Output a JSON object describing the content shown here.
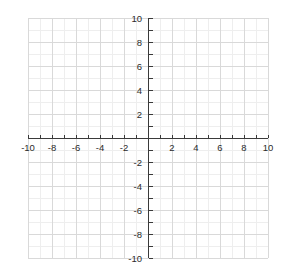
{
  "chart_data": {
    "type": "scatter",
    "title": "",
    "subtitle": "",
    "xlabel": "",
    "ylabel": "",
    "xlim": [
      -10,
      10
    ],
    "ylim": [
      -10,
      10
    ],
    "grid": true,
    "legend": null,
    "legend_position": "none",
    "series": [],
    "x": [],
    "values": [],
    "annotations": [],
    "x_tick_labels": [
      "-10",
      "-8",
      "-6",
      "-4",
      "-2",
      "2",
      "4",
      "6",
      "8",
      "10"
    ],
    "x_tick_values": [
      -10,
      -8,
      -6,
      -4,
      -2,
      2,
      4,
      6,
      8,
      10
    ],
    "y_tick_labels": [
      "10",
      "8",
      "6",
      "4",
      "2",
      "-2",
      "-4",
      "-6",
      "-8",
      "-10"
    ],
    "y_tick_values": [
      10,
      8,
      6,
      4,
      2,
      -2,
      -4,
      -6,
      -8,
      -10
    ],
    "origin_label": "",
    "tick_step_major": 2,
    "tick_step_minor": 1,
    "gridline_step_major": 2,
    "gridline_step_minor": 1,
    "colors": {
      "background": "#ffffff",
      "grid_major": "#d9d9d9",
      "grid_minor": "#eeeeee",
      "axis": "#3a3a3a",
      "tick_label": "#2b2b2b"
    }
  },
  "plot": {
    "name": "cartesian-coordinate-plane",
    "x_axis_name": "x-axis",
    "y_axis_name": "y-axis"
  }
}
